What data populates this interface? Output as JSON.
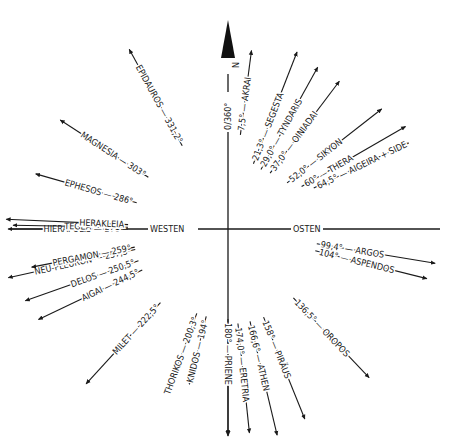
{
  "diagram": {
    "center": {
      "x": 228,
      "y": 229
    },
    "axes": {
      "north_label": "N",
      "north_value": "0/360°",
      "west_label": "WESTEN",
      "east_label": "OSTEN"
    },
    "rays": [
      {
        "name": "AKRAI",
        "deg": "7,5°",
        "angle": 7.5,
        "r1": 95,
        "r2": 180
      },
      {
        "name": "SEGESTA",
        "deg": "21,3°",
        "angle": 21.3,
        "r1": 70,
        "r2": 190
      },
      {
        "name": "TYNDARIS",
        "deg": "29,0°",
        "angle": 29.0,
        "r1": 68,
        "r2": 185
      },
      {
        "name": "OINIADAI",
        "deg": "37,0°",
        "angle": 37.0,
        "r1": 70,
        "r2": 185
      },
      {
        "name": "SIKYON",
        "deg": "52,0°",
        "angle": 52.0,
        "r1": 75,
        "r2": 195
      },
      {
        "name": "THERA",
        "deg": "60°",
        "angle": 60.0,
        "r1": 85,
        "r2": 205
      },
      {
        "name": "AIGEIRA + SIDE",
        "deg": "64,5°",
        "angle": 64.5,
        "r1": 95,
        "r2": 200
      },
      {
        "name": "ARGOS",
        "deg": "99,4°",
        "angle": 99.4,
        "r1": 90,
        "r2": 210
      },
      {
        "name": "ASPENDOS",
        "deg": "104°",
        "angle": 104.0,
        "r1": 90,
        "r2": 205
      },
      {
        "name": "OROPOS",
        "deg": "136,5°",
        "angle": 136.5,
        "r1": 95,
        "r2": 205
      },
      {
        "name": "PIRÄUS",
        "deg": "158°",
        "angle": 158.0,
        "r1": 95,
        "r2": 205
      },
      {
        "name": "ATHEN",
        "deg": "166,6°",
        "angle": 166.6,
        "r1": 95,
        "r2": 212
      },
      {
        "name": "ERETRIA",
        "deg": "174,0°",
        "angle": 174.0,
        "r1": 95,
        "r2": 205
      },
      {
        "name": "PRIENE",
        "deg": "180°",
        "angle": 180.0,
        "r1": 90,
        "r2": 205
      },
      {
        "name": "KNIDOS",
        "deg": "194°",
        "angle": 194.0,
        "r1": 90,
        "r2": 160
      },
      {
        "name": "THORIKOS",
        "deg": "200,3°",
        "angle": 200.3,
        "r1": 90,
        "r2": 160
      },
      {
        "name": "MILET",
        "deg": "222,5°",
        "angle": 222.5,
        "r1": 100,
        "r2": 210
      },
      {
        "name": "AIGAI",
        "deg": "244,5°",
        "angle": 244.5,
        "r1": 95,
        "r2": 210
      },
      {
        "name": "DELOS",
        "deg": "250,5°",
        "angle": 250.5,
        "r1": 95,
        "r2": 215
      },
      {
        "name": "NEU-PLEURON",
        "deg": "257,5°",
        "angle": 257.5,
        "r1": 95,
        "r2": 225
      },
      {
        "name": "PERGAMON",
        "deg": "259°",
        "angle": 259.0,
        "r1": 95,
        "r2": 200
      },
      {
        "name": "HIERAPOLIS",
        "deg": "270°",
        "angle": 270.0,
        "r1": 100,
        "r2": 220
      },
      {
        "name": "TEGEA",
        "deg": "271°",
        "angle": 271.0,
        "r1": 100,
        "r2": 215
      },
      {
        "name": "HERAKLEIA",
        "deg": "",
        "angle": 272.5,
        "r1": 100,
        "r2": 222
      },
      {
        "name": "EPHESOS",
        "deg": "286°",
        "angle": 286.0,
        "r1": 95,
        "r2": 200
      },
      {
        "name": "MAGNESIA",
        "deg": "303°",
        "angle": 303.0,
        "r1": 95,
        "r2": 200
      },
      {
        "name": "EPIDAUROS",
        "deg": "331,2°",
        "angle": 331.2,
        "r1": 95,
        "r2": 205
      }
    ]
  }
}
